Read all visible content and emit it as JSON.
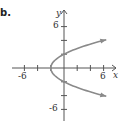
{
  "panel_label": "b.",
  "chart_data": {
    "type": "line",
    "title": "",
    "xlabel": "x",
    "ylabel": "y",
    "xlim": [
      -7.5,
      8
    ],
    "ylim": [
      -7,
      7.5
    ],
    "x_ticks": [
      -6,
      -4,
      -2,
      2,
      4,
      6
    ],
    "y_ticks": [
      -6,
      -4,
      -2,
      2,
      4,
      6
    ],
    "x_tick_labels": [
      "-6",
      "6"
    ],
    "y_tick_labels": [
      "6",
      "-6"
    ],
    "grid": false,
    "series": [
      {
        "name": "x = y^2/2 - 2",
        "equation": "x = y^2/2 - 2",
        "color": "#8a8a8a",
        "points": [
          {
            "x": 6,
            "y": 4
          },
          {
            "x": 2.5,
            "y": 3
          },
          {
            "x": 0,
            "y": 2
          },
          {
            "x": -1.5,
            "y": 1
          },
          {
            "x": -2,
            "y": 0
          },
          {
            "x": -1.5,
            "y": -1
          },
          {
            "x": 0,
            "y": -2
          },
          {
            "x": 2.5,
            "y": -3
          },
          {
            "x": 6,
            "y": -4
          }
        ],
        "arrows_at_ends": true
      }
    ],
    "key_points": [
      {
        "label": "vertex",
        "x": -2,
        "y": 0
      },
      {
        "label": "y-intercept",
        "x": 0,
        "y": 2
      },
      {
        "label": "y-intercept",
        "x": 0,
        "y": -2
      }
    ]
  },
  "labels": {
    "x_axis": "x",
    "y_axis": "y",
    "x_neg": "-6",
    "x_pos": "6",
    "y_pos": "6",
    "y_neg": "-6"
  }
}
